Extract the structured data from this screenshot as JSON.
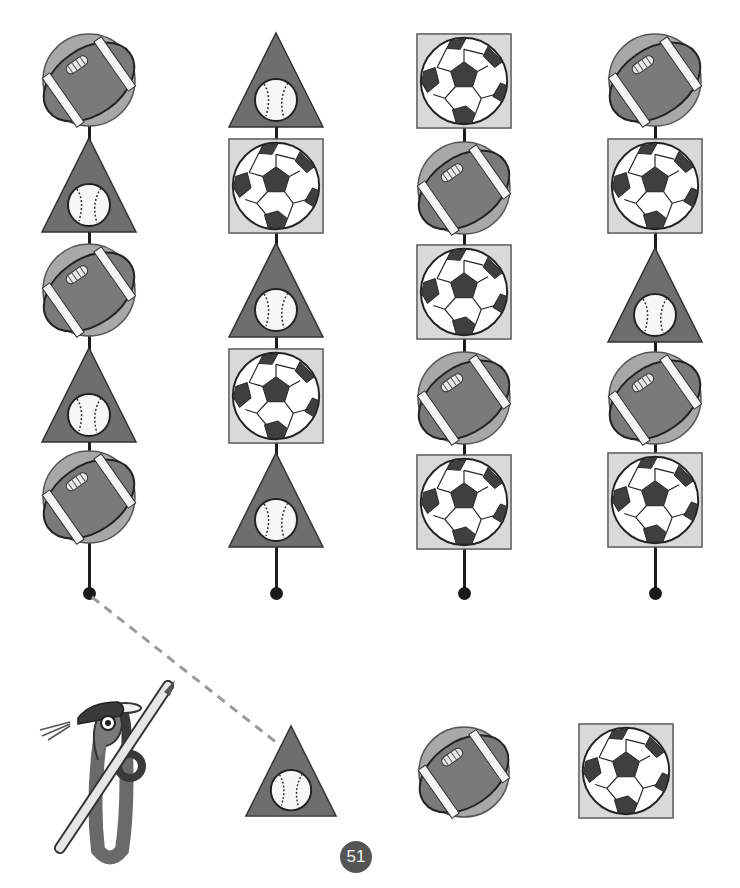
{
  "page": {
    "page_number": "51",
    "colors": {
      "triangle": "#6e6e6e",
      "square_bg": "#d9d9d9",
      "football_disc": "#a8a8a8",
      "football": "#7a7a7a",
      "soccer_dark": "#3f3f3f",
      "line": "#1c1c1c",
      "dash": "#9a9a9a",
      "page_badge": "#555555"
    }
  },
  "columns": [
    {
      "id": "column-1",
      "items": [
        "football",
        "baseball-triangle",
        "football",
        "baseball-triangle",
        "football"
      ]
    },
    {
      "id": "column-2",
      "items": [
        "baseball-triangle",
        "soccer-square",
        "baseball-triangle",
        "soccer-square",
        "baseball-triangle"
      ]
    },
    {
      "id": "column-3",
      "items": [
        "soccer-square",
        "football",
        "soccer-square",
        "football",
        "soccer-square"
      ]
    },
    {
      "id": "column-4",
      "items": [
        "football",
        "soccer-square",
        "baseball-triangle",
        "football",
        "soccer-square"
      ]
    }
  ],
  "answer_choices": [
    "baseball-triangle",
    "football",
    "soccer-square"
  ],
  "connection": {
    "from": "column-1-dot",
    "to": "answer-choice-baseball-triangle"
  }
}
